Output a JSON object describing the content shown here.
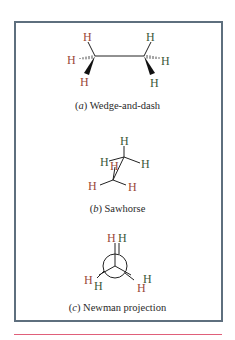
{
  "figure": {
    "panels": [
      {
        "id": "a",
        "letter": "a",
        "caption": "Wedge-and-dash"
      },
      {
        "id": "b",
        "letter": "b",
        "caption": "Sawhorse"
      },
      {
        "id": "c",
        "letter": "c",
        "caption": "Newman projection"
      }
    ],
    "atom_label": "H",
    "colors": {
      "front_carbon_h": "#9a4a3a",
      "back_carbon_h": "#3d5a3a",
      "frame_border": "#5e6f7e",
      "rule_line": "#e0607a",
      "bond": "#222222"
    }
  }
}
